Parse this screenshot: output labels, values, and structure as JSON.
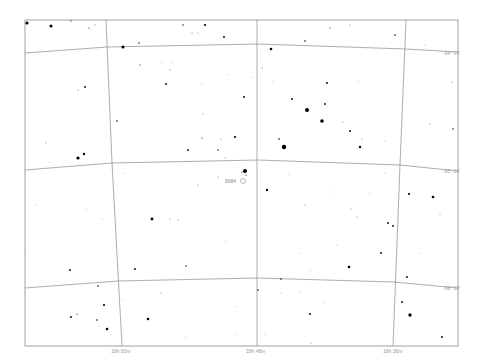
{
  "chart_data": {
    "type": "scatter",
    "projection": "equatorial sky chart (RA / Dec grid)",
    "frame": {
      "left": 25,
      "top": 20,
      "right": 458,
      "bottom": 346
    },
    "grid": true,
    "dec_lines": [
      {
        "label": "-64° 00'",
        "points": [
          [
            25,
            53
          ],
          [
            107,
            47
          ],
          [
            258,
            44
          ],
          [
            406,
            49
          ],
          [
            458,
            52
          ]
        ],
        "label_pos": [
          443,
          53
        ]
      },
      {
        "label": "-65° 00'",
        "points": [
          [
            25,
            170
          ],
          [
            112,
            163
          ],
          [
            258,
            160
          ],
          [
            400,
            165
          ],
          [
            458,
            171
          ]
        ],
        "label_pos": [
          443,
          171
        ]
      },
      {
        "label": "-66° 00'",
        "points": [
          [
            25,
            288
          ],
          [
            118,
            281
          ],
          [
            257,
            278
          ],
          [
            394,
            282
          ],
          [
            458,
            288
          ]
        ],
        "label_pos": [
          443,
          288
        ]
      }
    ],
    "ra_lines": [
      {
        "label": "19h 00m",
        "points": [
          [
            106,
            20
          ],
          [
            112,
            163
          ],
          [
            122,
            346
          ]
        ],
        "label_pos": [
          112,
          352
        ]
      },
      {
        "label": "18h 48m",
        "points": [
          [
            257,
            20
          ],
          [
            257,
            160
          ],
          [
            257,
            346
          ]
        ],
        "label_pos": [
          246,
          352
        ]
      },
      {
        "label": "18h 36m",
        "points": [
          [
            406,
            20
          ],
          [
            400,
            165
          ],
          [
            393,
            346
          ]
        ],
        "label_pos": [
          383,
          352
        ]
      }
    ],
    "annotations": [
      {
        "text": "6684",
        "x": 226,
        "y": 181,
        "type": "NGC object"
      }
    ],
    "stars": [
      {
        "x": 27,
        "y": 23,
        "r": 1.6
      },
      {
        "x": 51,
        "y": 26,
        "r": 1.5
      },
      {
        "x": 71,
        "y": 21,
        "r": 0.6
      },
      {
        "x": 89,
        "y": 28,
        "r": 0.6
      },
      {
        "x": 95,
        "y": 25,
        "r": 0.5
      },
      {
        "x": 183,
        "y": 25,
        "r": 0.7
      },
      {
        "x": 205,
        "y": 25,
        "r": 1.1
      },
      {
        "x": 192,
        "y": 33,
        "r": 0.5
      },
      {
        "x": 198,
        "y": 33,
        "r": 0.5
      },
      {
        "x": 224,
        "y": 37,
        "r": 0.9
      },
      {
        "x": 139,
        "y": 43,
        "r": 0.7
      },
      {
        "x": 123,
        "y": 47,
        "r": 1.6
      },
      {
        "x": 330,
        "y": 28,
        "r": 0.6
      },
      {
        "x": 350,
        "y": 25,
        "r": 0.5
      },
      {
        "x": 395,
        "y": 35,
        "r": 0.8
      },
      {
        "x": 305,
        "y": 41,
        "r": 0.8
      },
      {
        "x": 271,
        "y": 49,
        "r": 1.3
      },
      {
        "x": 425,
        "y": 45,
        "r": 0.4
      },
      {
        "x": 140,
        "y": 65,
        "r": 0.6
      },
      {
        "x": 162,
        "y": 62,
        "r": 0.4
      },
      {
        "x": 172,
        "y": 62,
        "r": 0.4
      },
      {
        "x": 170,
        "y": 70,
        "r": 0.5
      },
      {
        "x": 166,
        "y": 84,
        "r": 0.9
      },
      {
        "x": 202,
        "y": 84,
        "r": 0.4
      },
      {
        "x": 229,
        "y": 75,
        "r": 0.4
      },
      {
        "x": 251,
        "y": 77,
        "r": 0.4
      },
      {
        "x": 262,
        "y": 68,
        "r": 0.5
      },
      {
        "x": 273,
        "y": 82,
        "r": 0.4
      },
      {
        "x": 327,
        "y": 83,
        "r": 1.0
      },
      {
        "x": 358,
        "y": 82,
        "r": 0.4
      },
      {
        "x": 452,
        "y": 82,
        "r": 0.5
      },
      {
        "x": 85,
        "y": 87,
        "r": 0.9
      },
      {
        "x": 78,
        "y": 90,
        "r": 0.5
      },
      {
        "x": 244,
        "y": 97,
        "r": 0.9
      },
      {
        "x": 292,
        "y": 99,
        "r": 0.9
      },
      {
        "x": 307,
        "y": 110,
        "r": 2.0
      },
      {
        "x": 325,
        "y": 104,
        "r": 0.9
      },
      {
        "x": 203,
        "y": 114,
        "r": 0.5
      },
      {
        "x": 117,
        "y": 121,
        "r": 0.8
      },
      {
        "x": 322,
        "y": 121,
        "r": 1.8
      },
      {
        "x": 343,
        "y": 122,
        "r": 0.5
      },
      {
        "x": 350,
        "y": 131,
        "r": 1.0
      },
      {
        "x": 362,
        "y": 139,
        "r": 0.5
      },
      {
        "x": 385,
        "y": 141,
        "r": 0.4
      },
      {
        "x": 430,
        "y": 124,
        "r": 0.5
      },
      {
        "x": 453,
        "y": 129,
        "r": 0.7
      },
      {
        "x": 279,
        "y": 139,
        "r": 0.8
      },
      {
        "x": 235,
        "y": 137,
        "r": 1.1
      },
      {
        "x": 202,
        "y": 138,
        "r": 0.6
      },
      {
        "x": 221,
        "y": 139,
        "r": 0.5
      },
      {
        "x": 188,
        "y": 150,
        "r": 0.9
      },
      {
        "x": 218,
        "y": 150,
        "r": 0.7
      },
      {
        "x": 284,
        "y": 147,
        "r": 2.2
      },
      {
        "x": 360,
        "y": 147,
        "r": 1.2
      },
      {
        "x": 46,
        "y": 143,
        "r": 0.5
      },
      {
        "x": 84,
        "y": 154,
        "r": 1.2
      },
      {
        "x": 78,
        "y": 158,
        "r": 1.6
      },
      {
        "x": 50,
        "y": 162,
        "r": 0.4
      },
      {
        "x": 225,
        "y": 158,
        "r": 0.5
      },
      {
        "x": 245,
        "y": 171,
        "r": 2.0
      },
      {
        "x": 242,
        "y": 172,
        "r": 0.6
      },
      {
        "x": 246,
        "y": 175,
        "r": 0.6
      },
      {
        "x": 125,
        "y": 173,
        "r": 0.4
      },
      {
        "x": 198,
        "y": 185,
        "r": 0.5
      },
      {
        "x": 218,
        "y": 177,
        "r": 0.5
      },
      {
        "x": 267,
        "y": 190,
        "r": 1.2
      },
      {
        "x": 289,
        "y": 174,
        "r": 0.4
      },
      {
        "x": 409,
        "y": 194,
        "r": 1.1
      },
      {
        "x": 433,
        "y": 197,
        "r": 1.3
      },
      {
        "x": 334,
        "y": 192,
        "r": 0.4
      },
      {
        "x": 370,
        "y": 194,
        "r": 0.4
      },
      {
        "x": 385,
        "y": 173,
        "r": 0.4
      },
      {
        "x": 152,
        "y": 219,
        "r": 1.4
      },
      {
        "x": 170,
        "y": 219,
        "r": 0.5
      },
      {
        "x": 178,
        "y": 220,
        "r": 0.5
      },
      {
        "x": 305,
        "y": 205,
        "r": 0.5
      },
      {
        "x": 351,
        "y": 209,
        "r": 0.5
      },
      {
        "x": 357,
        "y": 217,
        "r": 0.5
      },
      {
        "x": 388,
        "y": 223,
        "r": 0.9
      },
      {
        "x": 393,
        "y": 226,
        "r": 0.9
      },
      {
        "x": 440,
        "y": 214,
        "r": 0.5
      },
      {
        "x": 36,
        "y": 205,
        "r": 0.4
      },
      {
        "x": 86,
        "y": 209,
        "r": 0.4
      },
      {
        "x": 102,
        "y": 219,
        "r": 0.4
      },
      {
        "x": 70,
        "y": 270,
        "r": 0.9
      },
      {
        "x": 135,
        "y": 269,
        "r": 0.9
      },
      {
        "x": 186,
        "y": 266,
        "r": 0.7
      },
      {
        "x": 299,
        "y": 253,
        "r": 0.4
      },
      {
        "x": 349,
        "y": 267,
        "r": 1.3
      },
      {
        "x": 381,
        "y": 253,
        "r": 0.9
      },
      {
        "x": 407,
        "y": 277,
        "r": 0.9
      },
      {
        "x": 419,
        "y": 253,
        "r": 0.4
      },
      {
        "x": 26,
        "y": 251,
        "r": 0.4
      },
      {
        "x": 226,
        "y": 242,
        "r": 0.4
      },
      {
        "x": 310,
        "y": 270,
        "r": 0.4
      },
      {
        "x": 337,
        "y": 245,
        "r": 0.4
      },
      {
        "x": 98,
        "y": 286,
        "r": 0.8
      },
      {
        "x": 161,
        "y": 293,
        "r": 0.5
      },
      {
        "x": 258,
        "y": 290,
        "r": 0.8
      },
      {
        "x": 281,
        "y": 279,
        "r": 0.8
      },
      {
        "x": 281,
        "y": 293,
        "r": 0.4
      },
      {
        "x": 301,
        "y": 292,
        "r": 0.4
      },
      {
        "x": 324,
        "y": 302,
        "r": 0.4
      },
      {
        "x": 402,
        "y": 302,
        "r": 0.9
      },
      {
        "x": 104,
        "y": 305,
        "r": 1.1
      },
      {
        "x": 71,
        "y": 317,
        "r": 0.9
      },
      {
        "x": 77,
        "y": 314,
        "r": 0.6
      },
      {
        "x": 97,
        "y": 320,
        "r": 0.8
      },
      {
        "x": 107,
        "y": 329,
        "r": 1.3
      },
      {
        "x": 99,
        "y": 326,
        "r": 0.4
      },
      {
        "x": 148,
        "y": 319,
        "r": 1.3
      },
      {
        "x": 235,
        "y": 307,
        "r": 0.4
      },
      {
        "x": 310,
        "y": 314,
        "r": 1.0
      },
      {
        "x": 410,
        "y": 315,
        "r": 1.7
      },
      {
        "x": 442,
        "y": 337,
        "r": 0.9
      },
      {
        "x": 311,
        "y": 343,
        "r": 0.5
      },
      {
        "x": 237,
        "y": 334,
        "r": 0.4
      },
      {
        "x": 265,
        "y": 334,
        "r": 0.4
      },
      {
        "x": 186,
        "y": 338,
        "r": 0.4
      },
      {
        "x": 122,
        "y": 300,
        "r": 0.4
      }
    ]
  },
  "labels": {
    "dec_64": "-64° 00'",
    "dec_65": "-65° 00'",
    "dec_66": "-66° 00'",
    "ra_1900": "19h 00m",
    "ra_1848": "18h 48m",
    "ra_1836": "18h 36m",
    "ngc_6684": "6684"
  },
  "colors": {
    "background": "#ffffff",
    "grid": "#8a8a8a",
    "star": "#000000",
    "label": "#999999"
  }
}
